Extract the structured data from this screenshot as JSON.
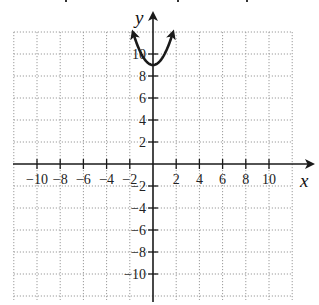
{
  "chart_data": {
    "type": "line",
    "title": "",
    "function": "y = x^2 + 9",
    "xlabel": "x",
    "ylabel": "y",
    "xlim": [
      -12,
      12
    ],
    "ylim": [
      -12,
      12
    ],
    "grid": true,
    "grid_step": 2,
    "x_ticks": [
      -10,
      -8,
      -6,
      -4,
      -2,
      2,
      4,
      6,
      8,
      10
    ],
    "y_ticks": [
      10,
      8,
      6,
      4,
      2,
      -2,
      -4,
      -6,
      -8,
      -10
    ],
    "x_tick_labels": [
      "−10",
      "−8",
      "−6",
      "−4",
      "−2",
      "2",
      "4",
      "6",
      "8",
      "10"
    ],
    "y_tick_labels": [
      "10",
      "8",
      "6",
      "4",
      "2",
      "−2",
      "−4",
      "−6",
      "−8",
      "−10"
    ],
    "series": [
      {
        "name": "parabola",
        "vertex": [
          0,
          9
        ],
        "x": [
          -1.7,
          -1.5,
          -1,
          -0.5,
          0,
          0.5,
          1,
          1.5,
          1.7
        ],
        "y": [
          11.89,
          11.25,
          10,
          9.25,
          9,
          9.25,
          10,
          11.25,
          11.89
        ],
        "arrows_at_ends": true
      }
    ]
  },
  "colors": {
    "axis": "#1a1a1a",
    "grid": "#9a9a9a",
    "curve": "#1a1a1a"
  }
}
